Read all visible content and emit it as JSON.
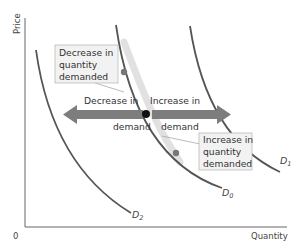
{
  "diagram": {
    "type": "demand-shift-vs-movement",
    "axes": {
      "y_label": "Price",
      "x_label": "Quantity",
      "origin_label": "0"
    },
    "curves": [
      {
        "id": "D0",
        "letter": "D",
        "subscript": "0",
        "role": "original demand"
      },
      {
        "id": "D1",
        "letter": "D",
        "subscript": "1",
        "role": "increased demand"
      },
      {
        "id": "D2",
        "letter": "D",
        "subscript": "2",
        "role": "decreased demand"
      }
    ],
    "arrows": {
      "left": {
        "line1": "Decrease in",
        "line2": "demand"
      },
      "right": {
        "line1": "Increase in",
        "line2": "demand"
      }
    },
    "callouts": {
      "upper": {
        "lines": [
          "Decrease in",
          "quantity",
          "demanded"
        ]
      },
      "lower": {
        "lines": [
          "Increase in",
          "quantity",
          "demanded"
        ]
      }
    },
    "colors": {
      "curve": "#555555",
      "arrow": "#7d7d7d",
      "movement_shade": "#d9d9d9",
      "callout_bg": "#f2f2f2",
      "callout_border": "#bbbbbb",
      "point_main": "#111111",
      "point_move": "#777777",
      "axis": "#666666"
    }
  }
}
